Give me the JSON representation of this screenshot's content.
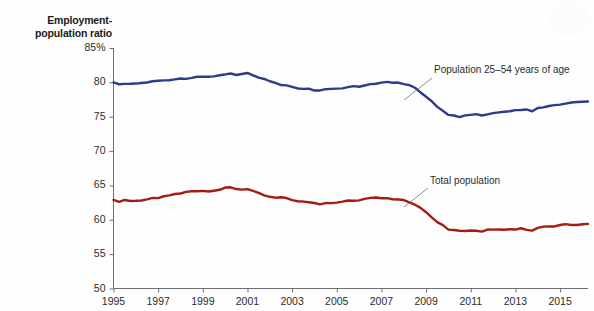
{
  "chart_data": {
    "type": "line",
    "title": "",
    "subtitle": "",
    "ylabel": "Employment-\npopulation ratio",
    "xlabel": "",
    "ylim": [
      50,
      85
    ],
    "xlim": [
      1995,
      2016.25
    ],
    "grid": false,
    "legend_position": "inline-annotations",
    "ytick_labels": [
      "85%",
      "80",
      "75",
      "70",
      "65",
      "60",
      "55",
      "50"
    ],
    "ytick_values": [
      85,
      80,
      75,
      70,
      65,
      60,
      55,
      50
    ],
    "xtick_labels": [
      "1995",
      "1997",
      "1999",
      "2001",
      "2003",
      "2005",
      "2007",
      "2009",
      "2011",
      "2013",
      "2015"
    ],
    "xtick_values": [
      1995,
      1997,
      1999,
      2001,
      2003,
      2005,
      2007,
      2009,
      2011,
      2013,
      2015
    ],
    "annotations": [
      {
        "text": "Population 25–54 years of age",
        "series": "prime_age",
        "x": 2011.0,
        "y": 81.6
      },
      {
        "text": "Total population",
        "series": "total",
        "x": 2010.3,
        "y": 63.0
      }
    ],
    "series": [
      {
        "name": "Population 25–54 years of age",
        "color": "#2e3a8c",
        "x": [
          1995.0,
          1995.25,
          1995.5,
          1995.75,
          1996.0,
          1996.25,
          1996.5,
          1996.75,
          1997.0,
          1997.25,
          1997.5,
          1997.75,
          1998.0,
          1998.25,
          1998.5,
          1998.75,
          1999.0,
          1999.25,
          1999.5,
          1999.75,
          2000.0,
          2000.25,
          2000.5,
          2000.75,
          2001.0,
          2001.25,
          2001.5,
          2001.75,
          2002.0,
          2002.25,
          2002.5,
          2002.75,
          2003.0,
          2003.25,
          2003.5,
          2003.75,
          2004.0,
          2004.25,
          2004.5,
          2004.75,
          2005.0,
          2005.25,
          2005.5,
          2005.75,
          2006.0,
          2006.25,
          2006.5,
          2006.75,
          2007.0,
          2007.25,
          2007.5,
          2007.75,
          2008.0,
          2008.25,
          2008.5,
          2008.75,
          2009.0,
          2009.25,
          2009.5,
          2009.75,
          2010.0,
          2010.25,
          2010.5,
          2010.75,
          2011.0,
          2011.25,
          2011.5,
          2011.75,
          2012.0,
          2012.25,
          2012.5,
          2012.75,
          2013.0,
          2013.25,
          2013.5,
          2013.75,
          2014.0,
          2014.25,
          2014.5,
          2014.75,
          2015.0,
          2015.25,
          2015.5,
          2015.75,
          2016.0,
          2016.25
        ],
        "y": [
          79.9,
          79.8,
          79.7,
          79.8,
          79.8,
          79.9,
          80.0,
          80.1,
          80.2,
          80.3,
          80.4,
          80.5,
          80.5,
          80.6,
          80.7,
          80.8,
          80.9,
          80.8,
          80.9,
          81.0,
          81.2,
          81.3,
          81.1,
          81.2,
          81.3,
          81.0,
          80.7,
          80.4,
          80.1,
          79.9,
          79.7,
          79.6,
          79.3,
          79.1,
          79.0,
          79.1,
          78.9,
          78.9,
          79.0,
          79.1,
          79.1,
          79.2,
          79.3,
          79.4,
          79.4,
          79.6,
          79.7,
          79.8,
          79.9,
          80.0,
          79.9,
          79.9,
          79.8,
          79.6,
          79.2,
          78.6,
          77.9,
          77.2,
          76.4,
          75.8,
          75.2,
          75.1,
          75.0,
          75.1,
          75.2,
          75.3,
          75.2,
          75.3,
          75.5,
          75.6,
          75.7,
          75.8,
          75.9,
          75.9,
          76.0,
          75.8,
          76.2,
          76.4,
          76.5,
          76.6,
          76.8,
          76.9,
          77.0,
          77.1,
          77.1,
          77.2
        ]
      },
      {
        "name": "Total population",
        "color": "#a51c16",
        "x": [
          1995.0,
          1995.25,
          1995.5,
          1995.75,
          1996.0,
          1996.25,
          1996.5,
          1996.75,
          1997.0,
          1997.25,
          1997.5,
          1997.75,
          1998.0,
          1998.25,
          1998.5,
          1998.75,
          1999.0,
          1999.25,
          1999.5,
          1999.75,
          2000.0,
          2000.25,
          2000.5,
          2000.75,
          2001.0,
          2001.25,
          2001.5,
          2001.75,
          2002.0,
          2002.25,
          2002.5,
          2002.75,
          2003.0,
          2003.25,
          2003.5,
          2003.75,
          2004.0,
          2004.25,
          2004.5,
          2004.75,
          2005.0,
          2005.25,
          2005.5,
          2005.75,
          2006.0,
          2006.25,
          2006.5,
          2006.75,
          2007.0,
          2007.25,
          2007.5,
          2007.75,
          2008.0,
          2008.25,
          2008.5,
          2008.75,
          2009.0,
          2009.25,
          2009.5,
          2009.75,
          2010.0,
          2010.25,
          2010.5,
          2010.75,
          2011.0,
          2011.25,
          2011.5,
          2011.75,
          2012.0,
          2012.25,
          2012.5,
          2012.75,
          2013.0,
          2013.25,
          2013.5,
          2013.75,
          2014.0,
          2014.25,
          2014.5,
          2014.75,
          2015.0,
          2015.25,
          2015.5,
          2015.75,
          2016.0,
          2016.25
        ],
        "y": [
          62.8,
          62.7,
          62.8,
          62.8,
          62.8,
          62.9,
          63.0,
          63.1,
          63.2,
          63.4,
          63.5,
          63.7,
          63.9,
          64.0,
          64.1,
          64.2,
          64.3,
          64.2,
          64.3,
          64.4,
          64.6,
          64.7,
          64.5,
          64.4,
          64.4,
          64.2,
          63.9,
          63.6,
          63.4,
          63.3,
          63.2,
          63.1,
          62.9,
          62.7,
          62.6,
          62.5,
          62.4,
          62.3,
          62.4,
          62.5,
          62.5,
          62.7,
          62.8,
          62.8,
          62.9,
          63.0,
          63.1,
          63.2,
          63.2,
          63.1,
          63.0,
          62.9,
          62.8,
          62.6,
          62.2,
          61.7,
          61.1,
          60.4,
          59.7,
          59.2,
          58.6,
          58.5,
          58.4,
          58.3,
          58.4,
          58.4,
          58.3,
          58.5,
          58.5,
          58.6,
          58.6,
          58.7,
          58.6,
          58.7,
          58.6,
          58.5,
          58.9,
          59.0,
          59.0,
          59.1,
          59.2,
          59.3,
          59.3,
          59.3,
          59.4,
          59.4
        ]
      }
    ]
  },
  "axis": {
    "ylabel_line1": "Employment-",
    "ylabel_line2": "population ratio"
  }
}
